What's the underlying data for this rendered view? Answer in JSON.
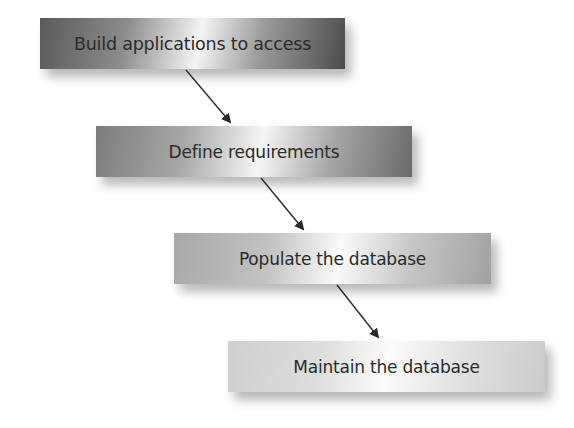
{
  "diagram": {
    "type": "process-flow",
    "steps": [
      {
        "label": "Build applications to access"
      },
      {
        "label": "Define requirements"
      },
      {
        "label": "Populate the database"
      },
      {
        "label": "Maintain the database"
      }
    ],
    "connectors": [
      {
        "from": 0,
        "to": 1,
        "icon": "arrow-down-right-icon"
      },
      {
        "from": 1,
        "to": 2,
        "icon": "arrow-down-right-icon"
      },
      {
        "from": 2,
        "to": 3,
        "icon": "arrow-down-right-icon"
      }
    ],
    "colors": {
      "arrow": "#2a2a2a",
      "text": "#2b2b2b",
      "background": "#ffffff"
    }
  }
}
